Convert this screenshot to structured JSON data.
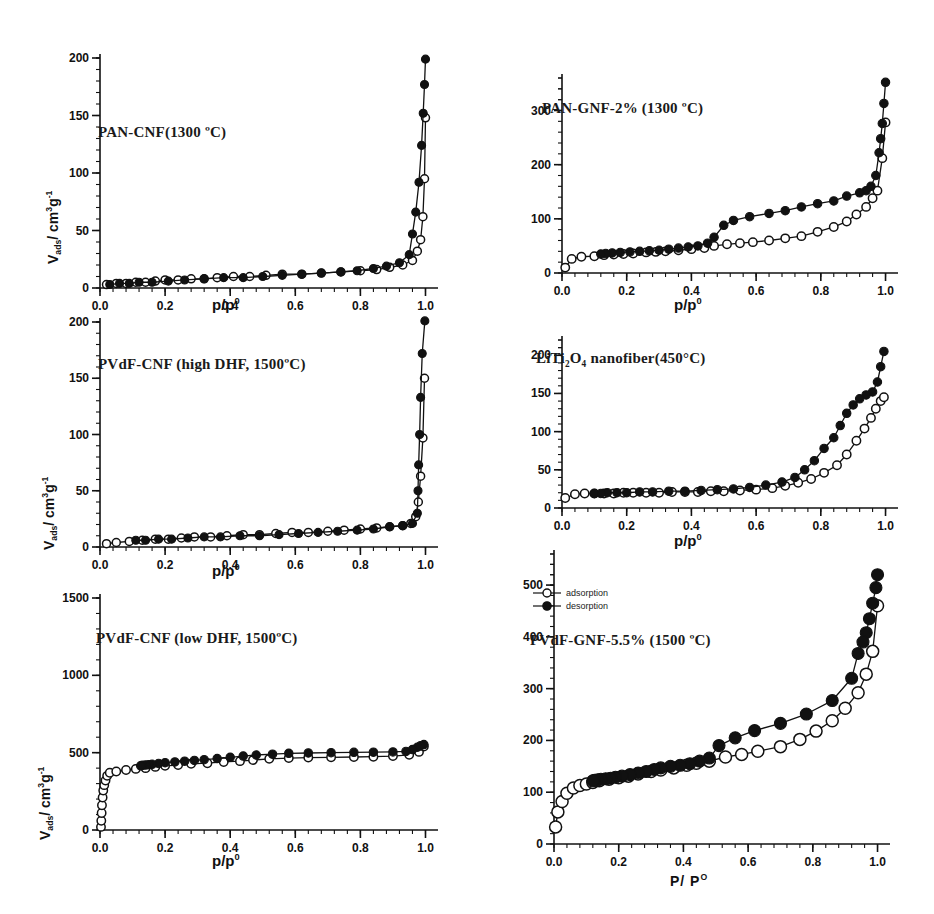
{
  "figure": {
    "legend": {
      "adsorption": "adsorption",
      "desorption": "desorption"
    },
    "axis": {
      "x_label_lower": "p/p",
      "x_label_lower_sup": "0",
      "x_label_caps": "P/ P",
      "x_label_caps_sup": "O",
      "y_label_main": "V",
      "y_label_sub": "ads",
      "y_label_unit": "/ cm",
      "y_label_unit_sup": "3",
      "y_label_unit2": "g",
      "y_label_unit2_sup": "-1"
    },
    "colors": {
      "ink": "#111111",
      "marker_open": "#ffffff",
      "marker_fill": "#111111"
    }
  },
  "chart_data": [
    {
      "id": "pan-cnf-1300",
      "type": "line",
      "title": "PAN-CNF(1300 ºC)",
      "xlabel": "p/p0",
      "ylabel": "Vads/ cm3g-1",
      "xlim": [
        0,
        1.02
      ],
      "ylim": [
        0,
        200
      ],
      "xticks": [
        0.0,
        0.2,
        0.4,
        0.6,
        0.8,
        1.0
      ],
      "yticks": [
        0,
        50,
        100,
        150,
        200
      ],
      "grid": false,
      "legend_position": "none",
      "series": [
        {
          "name": "adsorption",
          "marker": "open-circle",
          "x": [
            0.02,
            0.05,
            0.08,
            0.11,
            0.14,
            0.17,
            0.2,
            0.24,
            0.28,
            0.32,
            0.36,
            0.41,
            0.46,
            0.51,
            0.56,
            0.62,
            0.68,
            0.74,
            0.8,
            0.85,
            0.89,
            0.93,
            0.96,
            0.975,
            0.985,
            0.992,
            0.997,
            1.0
          ],
          "y": [
            3,
            4,
            4,
            5,
            5,
            6,
            7,
            7,
            8,
            8,
            9,
            10,
            10,
            11,
            12,
            12,
            13,
            14,
            15,
            16,
            18,
            20,
            24,
            32,
            42,
            62,
            95,
            148
          ]
        },
        {
          "name": "desorption",
          "marker": "filled-circle",
          "x": [
            1.0,
            0.997,
            0.993,
            0.988,
            0.98,
            0.97,
            0.96,
            0.95,
            0.92,
            0.88,
            0.84,
            0.79,
            0.74,
            0.68,
            0.62,
            0.56,
            0.5,
            0.44,
            0.38,
            0.32,
            0.26,
            0.21,
            0.16,
            0.12,
            0.09,
            0.06,
            0.03
          ],
          "y": [
            199,
            177,
            152,
            124,
            92,
            66,
            47,
            29,
            22,
            19,
            17,
            15,
            14,
            13,
            12,
            11,
            10,
            9,
            9,
            8,
            7,
            6,
            5,
            5,
            4,
            4,
            3
          ]
        }
      ]
    },
    {
      "id": "pvdf-cnf-high-dhf-1500",
      "type": "line",
      "title": "PVdF-CNF (high DHF, 1500ºC)",
      "xlabel": "p/p0",
      "ylabel": "Vads/ cm3g-1",
      "xlim": [
        0,
        1.02
      ],
      "ylim": [
        0,
        200
      ],
      "xticks": [
        0.0,
        0.2,
        0.4,
        0.6,
        0.8,
        1.0
      ],
      "yticks": [
        0,
        50,
        100,
        150,
        200
      ],
      "grid": false,
      "legend_position": "none",
      "series": [
        {
          "name": "adsorption",
          "marker": "open-circle",
          "x": [
            0.02,
            0.05,
            0.09,
            0.13,
            0.17,
            0.21,
            0.25,
            0.29,
            0.34,
            0.39,
            0.44,
            0.49,
            0.54,
            0.59,
            0.64,
            0.7,
            0.75,
            0.8,
            0.85,
            0.89,
            0.93,
            0.955,
            0.97,
            0.978,
            0.985,
            0.992,
            0.997
          ],
          "y": [
            3,
            4,
            5,
            6,
            7,
            7,
            8,
            9,
            9,
            10,
            11,
            11,
            12,
            13,
            13,
            14,
            15,
            16,
            17,
            18,
            19,
            21,
            27,
            40,
            63,
            97,
            150
          ]
        },
        {
          "name": "desorption",
          "marker": "filled-circle",
          "x": [
            0.998,
            0.99,
            0.985,
            0.982,
            0.979,
            0.977,
            0.975,
            0.96,
            0.93,
            0.89,
            0.84,
            0.79,
            0.73,
            0.67,
            0.61,
            0.55,
            0.49,
            0.43,
            0.37,
            0.32,
            0.27,
            0.22,
            0.18,
            0.14,
            0.11
          ],
          "y": [
            201,
            172,
            133,
            100,
            73,
            50,
            30,
            21,
            19,
            18,
            16,
            15,
            14,
            13,
            12,
            11,
            10,
            10,
            9,
            9,
            8,
            7,
            7,
            6,
            6
          ]
        }
      ]
    },
    {
      "id": "pvdf-cnf-low-dhf-1500",
      "type": "line",
      "title": "PVdF-CNF  (low DHF, 1500ºC)",
      "xlabel": "p/p0",
      "ylabel": "Vads/ cm3g-1",
      "xlim": [
        0,
        1.02
      ],
      "ylim": [
        0,
        1500
      ],
      "xticks": [
        0.0,
        0.2,
        0.4,
        0.6,
        0.8,
        1.0
      ],
      "yticks": [
        0,
        500,
        1000,
        1500
      ],
      "grid": false,
      "legend_position": "none",
      "series": [
        {
          "name": "adsorption",
          "marker": "open-circle",
          "x": [
            0.003,
            0.004,
            0.005,
            0.006,
            0.008,
            0.01,
            0.013,
            0.017,
            0.022,
            0.03,
            0.05,
            0.08,
            0.11,
            0.14,
            0.17,
            0.2,
            0.24,
            0.28,
            0.33,
            0.38,
            0.43,
            0.47,
            0.52,
            0.58,
            0.64,
            0.71,
            0.78,
            0.84,
            0.9,
            0.95,
            0.98,
            0.995
          ],
          "y": [
            20,
            60,
            110,
            160,
            210,
            255,
            290,
            320,
            350,
            370,
            378,
            388,
            395,
            400,
            408,
            415,
            420,
            428,
            432,
            440,
            445,
            452,
            460,
            465,
            468,
            470,
            472,
            474,
            478,
            486,
            505,
            540
          ]
        },
        {
          "name": "desorption",
          "marker": "filled-circle",
          "x": [
            0.995,
            0.985,
            0.975,
            0.96,
            0.94,
            0.9,
            0.84,
            0.78,
            0.71,
            0.64,
            0.58,
            0.53,
            0.48,
            0.44,
            0.4,
            0.36,
            0.32,
            0.29,
            0.26,
            0.23,
            0.2,
            0.18,
            0.16,
            0.15,
            0.14,
            0.13,
            0.125
          ],
          "y": [
            552,
            545,
            535,
            520,
            508,
            505,
            503,
            502,
            500,
            498,
            496,
            490,
            485,
            478,
            470,
            462,
            455,
            450,
            445,
            440,
            435,
            430,
            425,
            422,
            420,
            418,
            415
          ]
        }
      ]
    },
    {
      "id": "pan-gnf-2-1300",
      "type": "line",
      "title": "PAN-GNF-2% (1300 ºC)",
      "xlabel": "p/p0",
      "ylabel": "Vads/ cm3g-1",
      "xlim": [
        0,
        1.02
      ],
      "ylim": [
        0,
        360
      ],
      "xticks": [
        0.0,
        0.2,
        0.4,
        0.6,
        0.8,
        1.0
      ],
      "yticks": [
        0,
        100,
        200,
        300
      ],
      "grid": false,
      "legend_position": "none",
      "series": [
        {
          "name": "adsorption",
          "marker": "open-circle",
          "x": [
            0.01,
            0.03,
            0.06,
            0.1,
            0.13,
            0.16,
            0.19,
            0.22,
            0.26,
            0.29,
            0.32,
            0.36,
            0.4,
            0.44,
            0.47,
            0.51,
            0.55,
            0.59,
            0.64,
            0.69,
            0.74,
            0.79,
            0.84,
            0.88,
            0.91,
            0.94,
            0.96,
            0.975,
            0.99,
            1.0
          ],
          "y": [
            10,
            26,
            30,
            31,
            33,
            34,
            35,
            36,
            38,
            39,
            40,
            42,
            44,
            46,
            50,
            53,
            55,
            57,
            60,
            64,
            68,
            76,
            85,
            95,
            108,
            122,
            138,
            152,
            212,
            278
          ]
        },
        {
          "name": "desorption",
          "marker": "filled-circle",
          "x": [
            1.0,
            0.995,
            0.99,
            0.985,
            0.98,
            0.97,
            0.955,
            0.94,
            0.92,
            0.88,
            0.84,
            0.79,
            0.74,
            0.69,
            0.64,
            0.58,
            0.53,
            0.5,
            0.47,
            0.45,
            0.42,
            0.39,
            0.36,
            0.33,
            0.3,
            0.27,
            0.24,
            0.21,
            0.18,
            0.155,
            0.135,
            0.12
          ],
          "y": [
            352,
            313,
            276,
            248,
            222,
            180,
            160,
            152,
            148,
            142,
            133,
            128,
            122,
            115,
            110,
            104,
            97,
            88,
            66,
            55,
            50,
            48,
            46,
            44,
            42,
            41,
            40,
            39,
            38,
            37,
            36,
            35
          ]
        }
      ]
    },
    {
      "id": "liti2o4-nanofiber-450",
      "type": "line",
      "title": "LiTi2O4 nanofiber(450ºC)",
      "xlabel": "p/p0",
      "ylabel": "Vads/ cm3g-1",
      "xlim": [
        0,
        1.02
      ],
      "ylim": [
        0,
        220
      ],
      "xticks": [
        0.0,
        0.2,
        0.4,
        0.6,
        0.8,
        1.0
      ],
      "yticks": [
        0,
        50,
        100,
        150,
        200
      ],
      "grid": false,
      "legend_position": "none",
      "series": [
        {
          "name": "adsorption",
          "marker": "open-circle",
          "x": [
            0.01,
            0.04,
            0.07,
            0.1,
            0.13,
            0.16,
            0.19,
            0.22,
            0.26,
            0.3,
            0.34,
            0.38,
            0.42,
            0.46,
            0.5,
            0.55,
            0.6,
            0.65,
            0.69,
            0.73,
            0.77,
            0.81,
            0.85,
            0.88,
            0.91,
            0.935,
            0.955,
            0.97,
            0.985,
            0.995
          ],
          "y": [
            13,
            18,
            19,
            19,
            19,
            19,
            20,
            20,
            20,
            20,
            21,
            21,
            21,
            22,
            22,
            23,
            24,
            26,
            29,
            33,
            38,
            46,
            56,
            70,
            88,
            104,
            118,
            130,
            140,
            145
          ]
        },
        {
          "name": "desorption",
          "marker": "filled-circle",
          "x": [
            0.995,
            0.985,
            0.975,
            0.96,
            0.94,
            0.92,
            0.9,
            0.88,
            0.86,
            0.84,
            0.81,
            0.78,
            0.75,
            0.72,
            0.68,
            0.63,
            0.58,
            0.53,
            0.48,
            0.43,
            0.38,
            0.33,
            0.28,
            0.24,
            0.2,
            0.17,
            0.14,
            0.12,
            0.1
          ],
          "y": [
            205,
            185,
            165,
            152,
            148,
            143,
            135,
            124,
            108,
            92,
            78,
            62,
            50,
            40,
            34,
            30,
            27,
            25,
            24,
            23,
            22,
            22,
            21,
            21,
            20,
            20,
            20,
            19,
            19
          ]
        }
      ]
    },
    {
      "id": "pvdf-gnf-55-1500",
      "type": "line",
      "title": "PVdF-GNF-5.5% (1500 ºC)",
      "xlabel": "P/P O",
      "ylabel": "Vads/ cm3g-1",
      "xlim": [
        0,
        1.02
      ],
      "ylim": [
        0,
        560
      ],
      "xticks": [
        0.0,
        0.2,
        0.4,
        0.6,
        0.8,
        1.0
      ],
      "yticks": [
        0,
        100,
        200,
        300,
        400,
        500
      ],
      "grid": false,
      "legend_position": "upper-left",
      "series": [
        {
          "name": "adsorption",
          "marker": "open-circle",
          "x": [
            0.005,
            0.012,
            0.025,
            0.04,
            0.06,
            0.08,
            0.1,
            0.12,
            0.14,
            0.17,
            0.2,
            0.23,
            0.26,
            0.3,
            0.33,
            0.37,
            0.41,
            0.44,
            0.48,
            0.53,
            0.58,
            0.63,
            0.7,
            0.76,
            0.81,
            0.86,
            0.9,
            0.94,
            0.965,
            0.985,
            1.0
          ],
          "y": [
            33,
            62,
            82,
            98,
            108,
            113,
            116,
            119,
            122,
            125,
            128,
            131,
            135,
            140,
            143,
            147,
            152,
            156,
            160,
            168,
            173,
            179,
            188,
            202,
            218,
            238,
            262,
            292,
            328,
            372,
            460
          ]
        },
        {
          "name": "desorption",
          "marker": "filled-circle",
          "x": [
            1.0,
            0.995,
            0.985,
            0.975,
            0.965,
            0.955,
            0.94,
            0.92,
            0.86,
            0.78,
            0.7,
            0.62,
            0.56,
            0.51,
            0.48,
            0.45,
            0.42,
            0.39,
            0.36,
            0.33,
            0.31,
            0.285,
            0.26,
            0.235,
            0.21,
            0.19,
            0.175,
            0.16,
            0.145,
            0.135,
            0.125,
            0.12
          ],
          "y": [
            520,
            495,
            465,
            435,
            408,
            390,
            368,
            320,
            277,
            251,
            233,
            219,
            205,
            190,
            166,
            160,
            155,
            152,
            150,
            147,
            144,
            140,
            137,
            134,
            131,
            129,
            127,
            126,
            125,
            124,
            123,
            122
          ]
        }
      ]
    }
  ]
}
